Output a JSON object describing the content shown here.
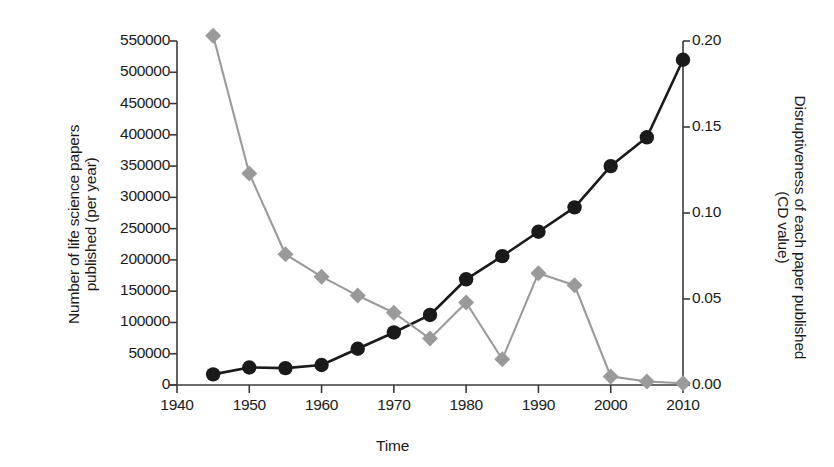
{
  "figure": {
    "background": "#ffffff",
    "x_axis": {
      "label": "Time",
      "ticks": [
        1940,
        1950,
        1960,
        1970,
        1980,
        1990,
        2000,
        2010
      ],
      "tick_labels": [
        "1940",
        "1950",
        "1960",
        "1970",
        "1980",
        "1990",
        "2000",
        "2010"
      ],
      "min": 1940,
      "max": 2010
    },
    "y_left": {
      "label_line1": "Number of life science papers",
      "label_line2": "published (per year)",
      "ticks": [
        0,
        50000,
        100000,
        150000,
        200000,
        250000,
        300000,
        350000,
        400000,
        450000,
        500000,
        550000
      ],
      "tick_labels": [
        "0",
        "50000",
        "100000",
        "150000",
        "200000",
        "250000",
        "300000",
        "350000",
        "400000",
        "450000",
        "500000",
        "550000"
      ],
      "min": 0,
      "max": 550000,
      "color": "#1a1a1a"
    },
    "y_right": {
      "label_line1": "Disruptiveness of each paper published",
      "label_line2": "(CD value)",
      "ticks": [
        0.0,
        0.05,
        0.1,
        0.15,
        0.2
      ],
      "tick_labels": [
        "0.00",
        "0.05",
        "0.10",
        "0.15",
        "0.20"
      ],
      "min": 0.0,
      "max": 0.2,
      "color": "#1a1a1a"
    }
  },
  "chart_data": {
    "type": "line",
    "title": "",
    "xlabel": "Time",
    "ylabel": "Number of life science papers published (per year)",
    "y2label": "Disruptiveness of each paper published (CD value)",
    "xlim": [
      1940,
      2010
    ],
    "ylim": [
      0,
      550000
    ],
    "y2lim": [
      0.0,
      0.2
    ],
    "grid": false,
    "legend": "none",
    "x": [
      1945,
      1950,
      1955,
      1960,
      1965,
      1970,
      1975,
      1980,
      1985,
      1990,
      1995,
      2000,
      2005,
      2010
    ],
    "series": [
      {
        "name": "Number of life science papers published (per year)",
        "axis": "left",
        "color": "#1a1a1a",
        "marker": "circle",
        "values": [
          17000,
          28000,
          27000,
          32000,
          58000,
          84000,
          112000,
          169000,
          206000,
          245000,
          284000,
          350000,
          396000,
          520000
        ]
      },
      {
        "name": "Disruptiveness of each paper published (CD value)",
        "axis": "right",
        "color": "#9a9a9a",
        "marker": "diamond",
        "values": [
          0.203,
          0.123,
          0.076,
          0.063,
          0.052,
          0.042,
          0.027,
          0.048,
          0.015,
          0.065,
          0.058,
          0.005,
          0.002,
          0.001
        ]
      }
    ]
  }
}
